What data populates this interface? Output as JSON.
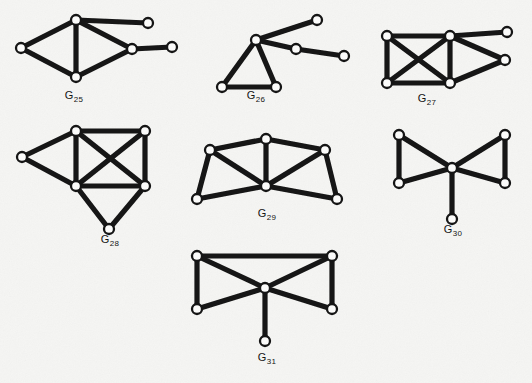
{
  "plate": {
    "width": 532,
    "height": 383,
    "background_color": "#f5f5f3",
    "ink_color": "#151515",
    "node_fill_color": "#fbfbfa",
    "node_stroke_color": "#151515",
    "edge_width": 5.2,
    "node_radius": 5.0,
    "node_stroke_width": 2.3,
    "label_font_size": 11,
    "label_sub_font_size": 8,
    "description": "Scanned book plate showing seven labelled graph diagrams G25 through G31 drawn with thick black edges and small open circular vertices."
  },
  "figures": [
    {
      "id": "G25",
      "label_main": "G",
      "label_sub": "25",
      "label_x": 74,
      "label_y": 99,
      "vertex_count": 6,
      "edge_count": 7,
      "nodes": [
        {
          "name": "left",
          "x": 21,
          "y": 48
        },
        {
          "name": "top",
          "x": 76,
          "y": 20
        },
        {
          "name": "bottom",
          "x": 76,
          "y": 77
        },
        {
          "name": "right-hub",
          "x": 132,
          "y": 49
        },
        {
          "name": "top-pendant",
          "x": 148,
          "y": 23
        },
        {
          "name": "far-right",
          "x": 172,
          "y": 47
        }
      ],
      "edges": [
        [
          "left",
          "top"
        ],
        [
          "left",
          "bottom"
        ],
        [
          "top",
          "bottom"
        ],
        [
          "top",
          "right-hub"
        ],
        [
          "bottom",
          "right-hub"
        ],
        [
          "top",
          "top-pendant"
        ],
        [
          "right-hub",
          "far-right"
        ]
      ]
    },
    {
      "id": "G26",
      "label_main": "G",
      "label_sub": "26",
      "label_x": 256,
      "label_y": 99,
      "vertex_count": 6,
      "edge_count": 6,
      "nodes": [
        {
          "name": "apex",
          "x": 256,
          "y": 40
        },
        {
          "name": "bottom-left",
          "x": 222,
          "y": 87
        },
        {
          "name": "bottom-right",
          "x": 276,
          "y": 87
        },
        {
          "name": "upper-arm",
          "x": 317,
          "y": 20
        },
        {
          "name": "mid-arm",
          "x": 296,
          "y": 49
        },
        {
          "name": "far-arm",
          "x": 344,
          "y": 56
        }
      ],
      "edges": [
        [
          "apex",
          "bottom-left"
        ],
        [
          "apex",
          "bottom-right"
        ],
        [
          "bottom-left",
          "bottom-right"
        ],
        [
          "apex",
          "upper-arm"
        ],
        [
          "apex",
          "mid-arm"
        ],
        [
          "mid-arm",
          "far-arm"
        ]
      ]
    },
    {
      "id": "G27",
      "label_main": "G",
      "label_sub": "27",
      "label_x": 427,
      "label_y": 102,
      "vertex_count": 6,
      "edge_count": 9,
      "nodes": [
        {
          "name": "top-left",
          "x": 387,
          "y": 36
        },
        {
          "name": "bottom-left",
          "x": 387,
          "y": 83
        },
        {
          "name": "top-mid",
          "x": 450,
          "y": 36
        },
        {
          "name": "bottom-mid",
          "x": 450,
          "y": 83
        },
        {
          "name": "right-apex",
          "x": 505,
          "y": 60
        },
        {
          "name": "top-right",
          "x": 507,
          "y": 32
        }
      ],
      "edges": [
        [
          "top-left",
          "bottom-left"
        ],
        [
          "top-left",
          "top-mid"
        ],
        [
          "bottom-left",
          "bottom-mid"
        ],
        [
          "top-mid",
          "bottom-mid"
        ],
        [
          "top-left",
          "bottom-mid"
        ],
        [
          "bottom-left",
          "top-mid"
        ],
        [
          "top-mid",
          "right-apex"
        ],
        [
          "bottom-mid",
          "right-apex"
        ],
        [
          "top-mid",
          "top-right"
        ]
      ]
    },
    {
      "id": "G28",
      "label_main": "G",
      "label_sub": "28",
      "label_x": 110,
      "label_y": 243,
      "vertex_count": 6,
      "edge_count": 10,
      "nodes": [
        {
          "name": "left",
          "x": 22,
          "y": 157
        },
        {
          "name": "top-left",
          "x": 76,
          "y": 131
        },
        {
          "name": "top-right",
          "x": 145,
          "y": 131
        },
        {
          "name": "mid-left",
          "x": 76,
          "y": 186
        },
        {
          "name": "mid-right",
          "x": 145,
          "y": 186
        },
        {
          "name": "bottom",
          "x": 109,
          "y": 229
        }
      ],
      "edges": [
        [
          "left",
          "top-left"
        ],
        [
          "left",
          "mid-left"
        ],
        [
          "top-left",
          "top-right"
        ],
        [
          "top-left",
          "mid-left"
        ],
        [
          "top-right",
          "mid-right"
        ],
        [
          "mid-left",
          "mid-right"
        ],
        [
          "top-left",
          "mid-right"
        ],
        [
          "top-right",
          "mid-left"
        ],
        [
          "mid-left",
          "bottom"
        ],
        [
          "mid-right",
          "bottom"
        ]
      ]
    },
    {
      "id": "G29",
      "label_main": "G",
      "label_sub": "29",
      "label_x": 267,
      "label_y": 217,
      "vertex_count": 6,
      "edge_count": 9,
      "nodes": [
        {
          "name": "top-mid",
          "x": 266,
          "y": 139
        },
        {
          "name": "upper-left",
          "x": 210,
          "y": 150
        },
        {
          "name": "upper-right",
          "x": 325,
          "y": 150
        },
        {
          "name": "center",
          "x": 266,
          "y": 186
        },
        {
          "name": "bottom-left",
          "x": 197,
          "y": 199
        },
        {
          "name": "bottom-right",
          "x": 337,
          "y": 199
        }
      ],
      "edges": [
        [
          "top-mid",
          "upper-left"
        ],
        [
          "top-mid",
          "upper-right"
        ],
        [
          "top-mid",
          "center"
        ],
        [
          "upper-left",
          "bottom-left"
        ],
        [
          "upper-left",
          "center"
        ],
        [
          "upper-right",
          "bottom-right"
        ],
        [
          "upper-right",
          "center"
        ],
        [
          "bottom-left",
          "center"
        ],
        [
          "bottom-right",
          "center"
        ]
      ]
    },
    {
      "id": "G30",
      "label_main": "G",
      "label_sub": "30",
      "label_x": 453,
      "label_y": 233,
      "vertex_count": 6,
      "edge_count": 7,
      "nodes": [
        {
          "name": "center",
          "x": 452,
          "y": 168
        },
        {
          "name": "top-left",
          "x": 399,
          "y": 135
        },
        {
          "name": "bottom-left",
          "x": 399,
          "y": 183
        },
        {
          "name": "top-right",
          "x": 505,
          "y": 135
        },
        {
          "name": "bottom-right",
          "x": 505,
          "y": 183
        },
        {
          "name": "pendant",
          "x": 452,
          "y": 219
        }
      ],
      "edges": [
        [
          "center",
          "top-left"
        ],
        [
          "center",
          "bottom-left"
        ],
        [
          "top-left",
          "bottom-left"
        ],
        [
          "center",
          "top-right"
        ],
        [
          "center",
          "bottom-right"
        ],
        [
          "top-right",
          "bottom-right"
        ],
        [
          "center",
          "pendant"
        ]
      ]
    },
    {
      "id": "G31",
      "label_main": "G",
      "label_sub": "31",
      "label_x": 267,
      "label_y": 361,
      "vertex_count": 6,
      "edge_count": 8,
      "nodes": [
        {
          "name": "center",
          "x": 265,
          "y": 288
        },
        {
          "name": "top-left",
          "x": 197,
          "y": 256
        },
        {
          "name": "bottom-left",
          "x": 197,
          "y": 309
        },
        {
          "name": "top-right",
          "x": 332,
          "y": 256
        },
        {
          "name": "bottom-right",
          "x": 332,
          "y": 309
        },
        {
          "name": "pendant",
          "x": 265,
          "y": 341
        }
      ],
      "edges": [
        [
          "center",
          "top-left"
        ],
        [
          "center",
          "bottom-left"
        ],
        [
          "top-left",
          "bottom-left"
        ],
        [
          "center",
          "top-right"
        ],
        [
          "center",
          "bottom-right"
        ],
        [
          "top-right",
          "bottom-right"
        ],
        [
          "top-left",
          "top-right"
        ],
        [
          "center",
          "pendant"
        ]
      ]
    }
  ]
}
